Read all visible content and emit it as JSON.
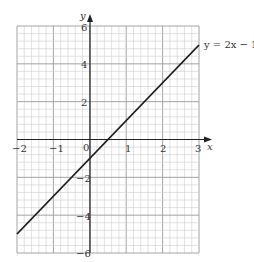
{
  "chart_data": {
    "type": "line",
    "title": "",
    "xlabel": "x",
    "ylabel": "y",
    "xlim": [
      -2,
      3
    ],
    "ylim": [
      -6,
      6
    ],
    "grid": true,
    "x_ticks": [
      -2,
      -1,
      0,
      1,
      2,
      3
    ],
    "x_tick_labels": [
      "−2",
      "−1",
      "0",
      "1",
      "2",
      "3"
    ],
    "y_ticks": [
      -6,
      -4,
      -2,
      2,
      4,
      6
    ],
    "y_tick_labels": [
      "−6",
      "−4",
      "−2",
      "2",
      "4",
      "6"
    ],
    "series": [
      {
        "name": "y = 2x − 1",
        "x": [
          -2,
          3
        ],
        "y": [
          -5,
          5
        ],
        "color": "#1a1a1a"
      }
    ],
    "annotations": [
      {
        "text": "y = 2x − 1",
        "x": 3,
        "y": 5
      }
    ]
  },
  "labels": {
    "x_axis": "x",
    "y_axis": "y",
    "origin": "0",
    "line_label": "y = 2x − 1",
    "xt_m2": "−2",
    "xt_m1": "−1",
    "xt_1": "1",
    "xt_2": "2",
    "xt_3": "3",
    "yt_6": "6",
    "yt_4": "4",
    "yt_2": "2",
    "yt_m2": "−2",
    "yt_m4": "−4",
    "yt_m6": "−6"
  }
}
